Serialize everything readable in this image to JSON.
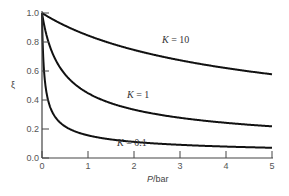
{
  "chart_data": {
    "type": "line",
    "title": "",
    "xlabel": "P/bar",
    "ylabel": "ξ",
    "xlim": [
      0,
      5
    ],
    "ylim": [
      0,
      1.0
    ],
    "xticks": [
      "0",
      "1",
      "2",
      "3",
      "4",
      "5"
    ],
    "yticks": [
      "0.0",
      "0.2",
      "0.4",
      "0.6",
      "0.8",
      "1.0"
    ],
    "grid": false,
    "legend": "inline labels",
    "x": [
      0,
      0.05,
      0.1,
      0.2,
      0.3,
      0.5,
      0.75,
      1,
      1.5,
      2,
      2.5,
      3,
      3.5,
      4,
      4.5,
      5
    ],
    "series": [
      {
        "name": "K = 10",
        "label_k": "K",
        "label_eq": " = 10",
        "values": [
          1.0,
          0.995,
          0.99,
          0.981,
          0.971,
          0.953,
          0.928,
          0.845,
          0.791,
          0.745,
          0.707,
          0.674,
          0.645,
          0.62,
          0.598,
          0.577
        ]
      },
      {
        "name": "K = 1",
        "label_k": "K",
        "label_eq": " = 1",
        "values": [
          1.0,
          0.913,
          0.845,
          0.745,
          0.674,
          0.577,
          0.5,
          0.447,
          0.378,
          0.333,
          0.302,
          0.277,
          0.258,
          0.243,
          0.229,
          0.218
        ]
      },
      {
        "name": "K = 0.1",
        "label_k": "K",
        "label_eq": " = 0.1",
        "values": [
          1.0,
          0.577,
          0.447,
          0.333,
          0.277,
          0.218,
          0.18,
          0.156,
          0.128,
          0.111,
          0.099,
          0.091,
          0.084,
          0.079,
          0.074,
          0.07
        ]
      }
    ]
  }
}
